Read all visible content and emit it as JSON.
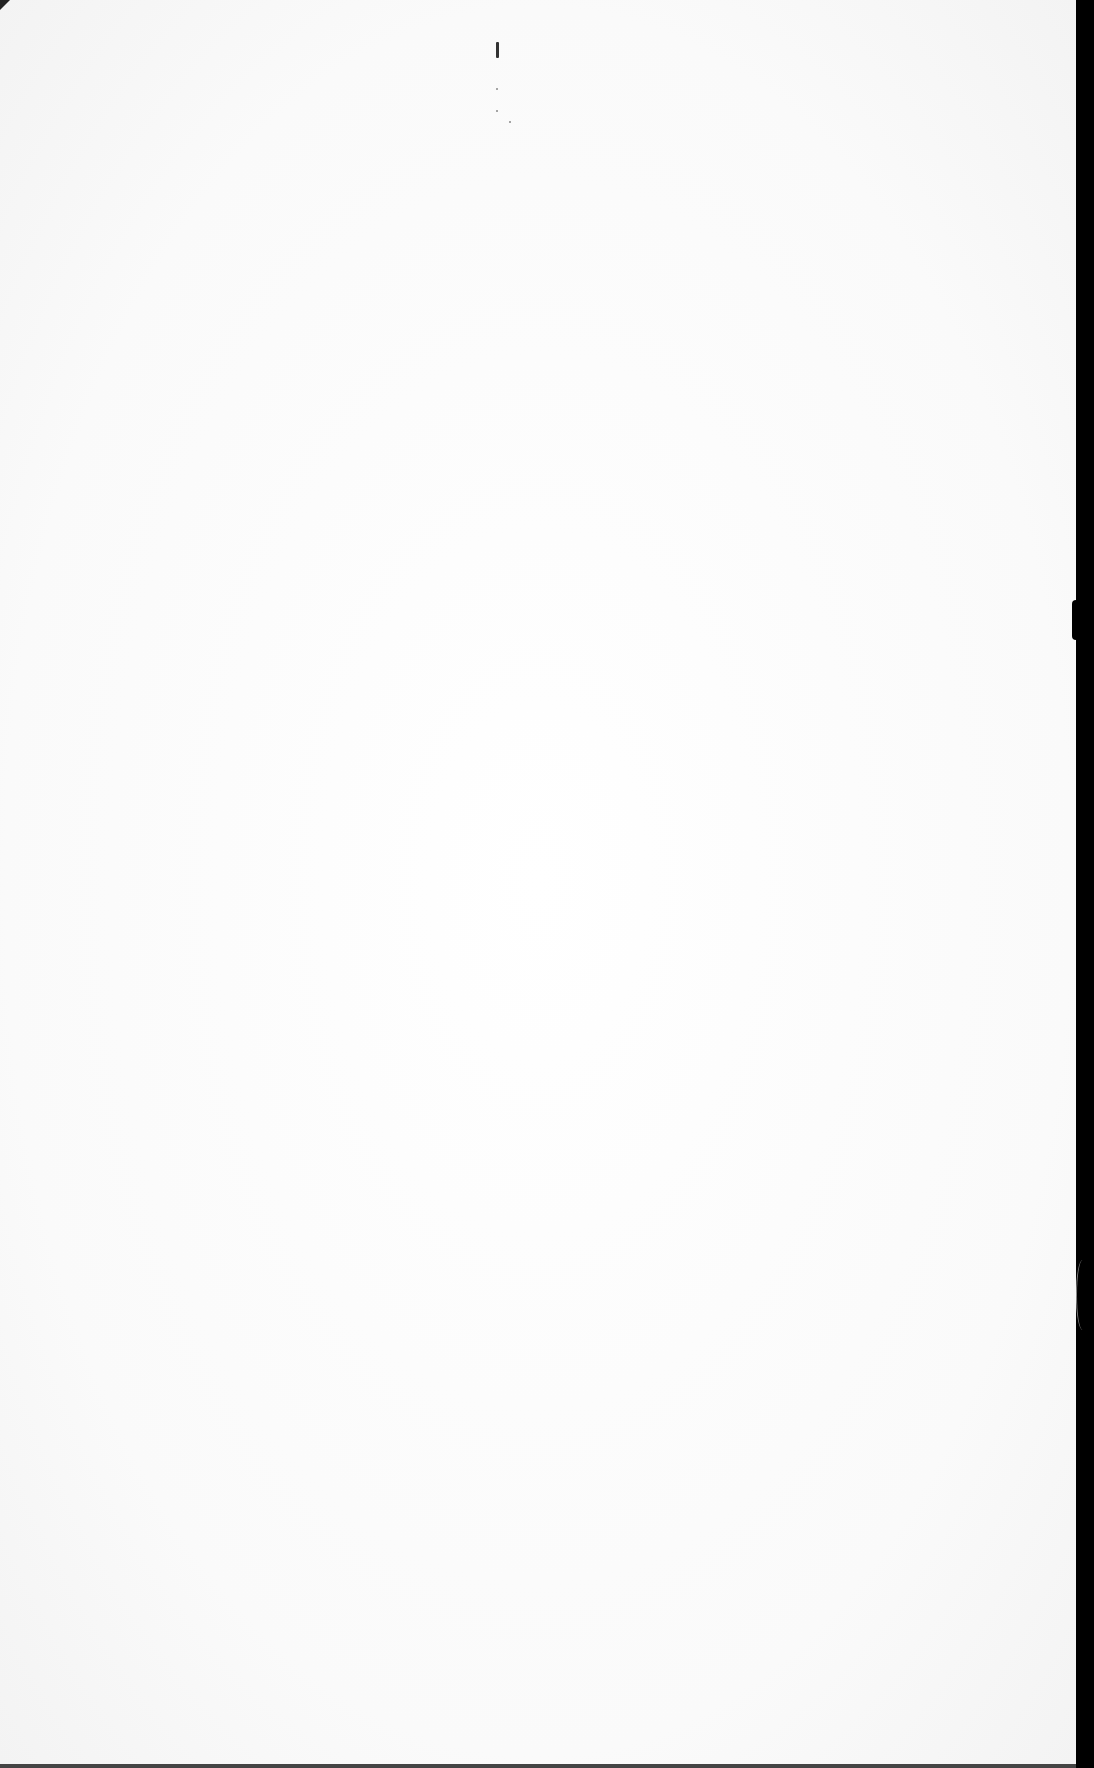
{
  "document": {
    "type": "blank scanned page",
    "text": "",
    "marks": [
      "small vertical mark near top center",
      "faint specks"
    ],
    "colors": {
      "paper": "#fdfdfd",
      "border": "#000000"
    }
  }
}
